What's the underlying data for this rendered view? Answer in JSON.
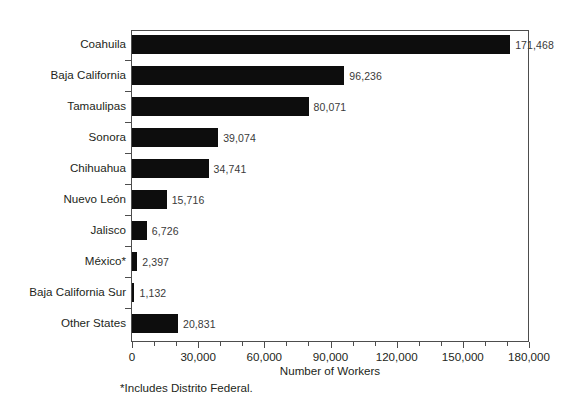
{
  "chart_data": {
    "type": "bar",
    "orientation": "horizontal",
    "title": "",
    "subtitle": "",
    "xlabel": "Number of Workers",
    "ylabel": "",
    "xlim": [
      0,
      180000
    ],
    "grid": false,
    "legend": null,
    "bar_color": "#0d0d0d",
    "axis_color": "#4d4d4d",
    "text_color": "#231f20",
    "categories": [
      "Coahuila",
      "Baja California",
      "Tamaulipas",
      "Sonora",
      "Chihuahua",
      "Nuevo León",
      "Jalisco",
      "México*",
      "Baja California Sur",
      "Other States"
    ],
    "values": [
      171468,
      96236,
      80071,
      39074,
      34741,
      15716,
      6726,
      2397,
      1132,
      20831
    ],
    "value_labels": [
      "171,468",
      "96,236",
      "80,071",
      "39,074",
      "34,741",
      "15,716",
      "6,726",
      "2,397",
      "1,132",
      "20,831"
    ],
    "xticks": [
      0,
      30000,
      60000,
      90000,
      120000,
      150000,
      180000
    ],
    "xtick_labels": [
      "0",
      "30,000",
      "60,000",
      "90,000",
      "120,000",
      "150,000",
      "180,000"
    ],
    "xminor_step": 10000,
    "footnote": "*Includes Distrito Federal."
  }
}
